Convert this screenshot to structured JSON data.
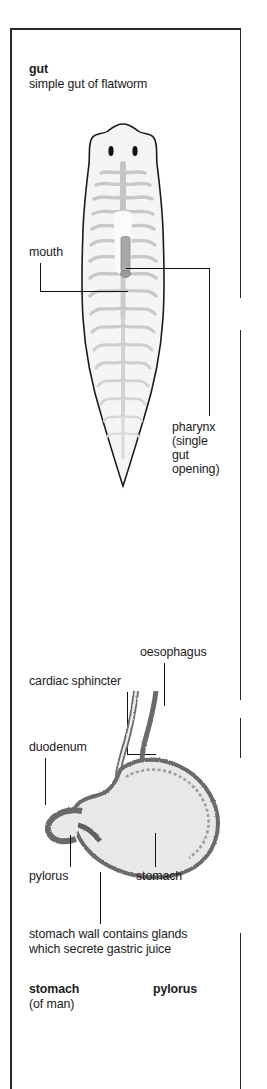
{
  "page": {
    "background_color": "#ffffff",
    "frame_color": "#2a2a2a"
  },
  "panels": [
    {
      "id": "flatworm-panel",
      "heading": "gut",
      "subheading": "simple gut of flatworm",
      "figure": {
        "name": "flatworm-diagram",
        "organism": "flatworm",
        "outline_color": "#1a1a1a",
        "body_fill": "#f4f4f4",
        "gut_color": "#c9c9c9",
        "eye_color": "#111111"
      },
      "labels": [
        {
          "name": "label-mouth",
          "text": "mouth"
        },
        {
          "name": "label-pharynx",
          "lines": [
            "pharynx",
            "(single",
            "gut",
            "opening)"
          ]
        }
      ]
    },
    {
      "id": "stomach-panel",
      "figure": {
        "name": "stomach-diagram",
        "organism": "human stomach",
        "wall_color": "#6b6b6b",
        "lumen_fill": "#e2e2e2",
        "outline_color": "#3d3d3d"
      },
      "labels": [
        {
          "name": "label-oesophagus",
          "text": "oesophagus"
        },
        {
          "name": "label-cardiac-sphincter",
          "text": "cardiac sphincter"
        },
        {
          "name": "label-duodenum",
          "text": "duodenum"
        },
        {
          "name": "label-pylorus",
          "text": "pylorus"
        },
        {
          "name": "label-stomach",
          "text": "stomach"
        },
        {
          "name": "label-stomach-wall-note",
          "lines": [
            "stomach wall contains glands",
            "which secrete gastric juice"
          ]
        }
      ],
      "captions": {
        "title_left": "stomach",
        "subtitle_left": "(of man)",
        "title_right": "pylorus"
      }
    }
  ]
}
